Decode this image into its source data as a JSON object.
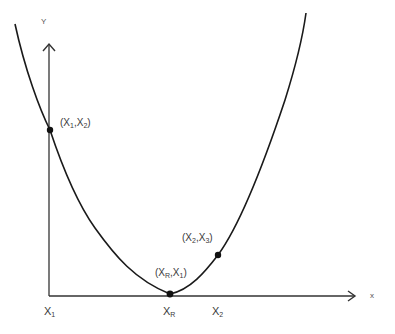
{
  "diagram": {
    "type": "convex function with sampled points",
    "axes": {
      "y_label": "Y",
      "x_label": "x"
    },
    "x_ticks": [
      {
        "main": "X",
        "sub": "1"
      },
      {
        "main": "X",
        "sub": "R"
      },
      {
        "main": "X",
        "sub": "2"
      }
    ],
    "points": [
      {
        "label_a": "X",
        "sub_a": "1",
        "label_b": "X",
        "sub_b": "2"
      },
      {
        "label_a": "X",
        "sub_a": "R",
        "label_b": "X",
        "sub_b": "1"
      },
      {
        "label_a": "X",
        "sub_a": "2",
        "label_b": "X",
        "sub_b": "3"
      }
    ],
    "colors": {
      "line": "#1a1a1a",
      "text": "#3a3a3a"
    }
  }
}
